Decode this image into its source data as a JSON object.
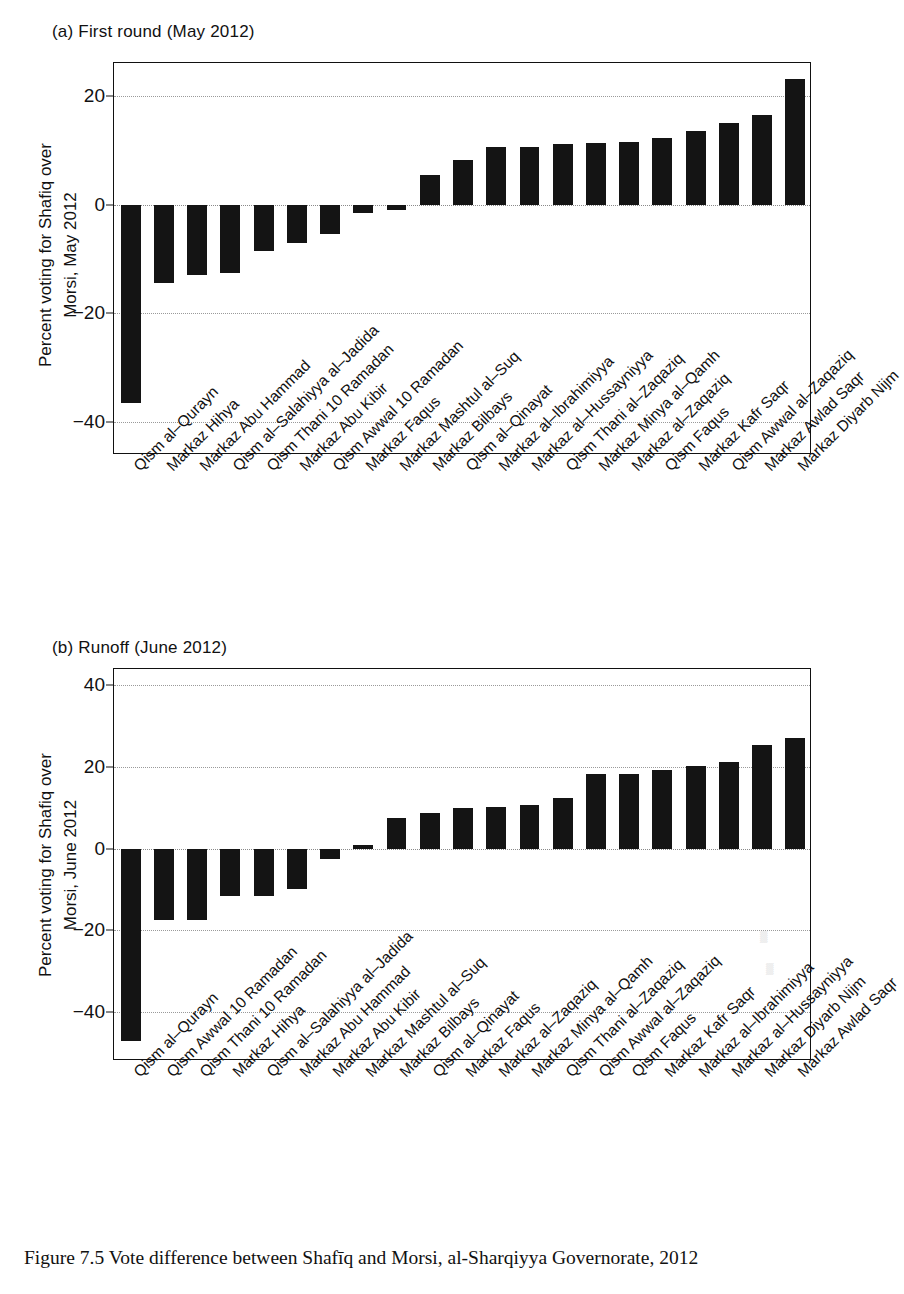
{
  "caption": "Figure 7.5  Vote difference between Shafīq and Morsi, al-Sharqiyya Governorate, 2012",
  "panel_a": {
    "title": "(a) First round (May 2012)",
    "ylabel_line1": "Percent voting for Shafiq over",
    "ylabel_line2": "Morsi, May 2012"
  },
  "panel_b": {
    "title": "(b) Runoff (June 2012)",
    "ylabel_line1": "Percent voting for Shafiq over",
    "ylabel_line2": "Morsi, June 2012"
  },
  "chart_data": [
    {
      "type": "bar",
      "title": "(a) First round (May 2012)",
      "xlabel": "",
      "ylabel": "Percent voting for Shafiq over Morsi, May 2012",
      "ylim": [
        -46,
        26
      ],
      "yticks": [
        20,
        0,
        -20,
        -40
      ],
      "ytick_labels": [
        "20",
        "0",
        "-20",
        "-40"
      ],
      "grid": true,
      "legend": "none",
      "categories": [
        "Qism al-Qurayn",
        "Markaz Hihya",
        "Markaz Abu Hammad",
        "Qism al-Salahiyya al-Jadida",
        "Qism Thani 10 Ramadan",
        "Markaz Abu Kibir",
        "Qism Awwal 10 Ramadan",
        "Markaz Faqus",
        "Markaz Mashtul al-Suq",
        "Markaz Bilbays",
        "Qism al-Qinayat",
        "Markaz al-Ibrahimiyya",
        "Markaz al-Hussayniyya",
        "Qism Thani al-Zaqaziq",
        "Markaz Minya al-Qamh",
        "Markaz al-Zaqaziq",
        "Qism Faqus",
        "Markaz Kafr Saqr",
        "Qism Awwal al-Zaqaziq",
        "Markaz Awlad Saqr",
        "Markaz Diyarb Nijm"
      ],
      "values": [
        -36.5,
        -14.5,
        -13.0,
        -12.5,
        -8.5,
        -7.0,
        -5.5,
        -1.5,
        -1.0,
        5.5,
        8.2,
        10.5,
        10.6,
        11.2,
        11.3,
        11.5,
        12.3,
        13.6,
        15.0,
        16.4,
        23.0
      ]
    },
    {
      "type": "bar",
      "title": "(b) Runoff (June 2012)",
      "xlabel": "",
      "ylabel": "Percent voting for Shafiq over Morsi, June 2012",
      "ylim": [
        -52,
        44
      ],
      "yticks": [
        40,
        20,
        0,
        -20,
        -40
      ],
      "ytick_labels": [
        "40",
        "20",
        "0",
        "-20",
        "-40"
      ],
      "grid": true,
      "legend": "none",
      "categories": [
        "Qism al-Qurayn",
        "Qism Awwal 10 Ramadan",
        "Qism Thani 10 Ramadan",
        "Markaz Hihya",
        "Qism al-Salahiyya al-Jadida",
        "Markaz Abu Hammad",
        "Markaz Abu Kibir",
        "Markaz Mashtul al-Suq",
        "Markaz Bilbays",
        "Qism al-Qinayat",
        "Markaz Faqus",
        "Markaz al-Zaqaziq",
        "Markaz Minya al-Qamh",
        "Qism Thani al-Zaqaziq",
        "Qism Awwal al-Zaqaziq",
        "Qism Faqus",
        "Markaz Kafr Saqr",
        "Markaz al-Ibrahimiyya",
        "Markaz al-Hussayniyya",
        "Markaz Diyarb Nijm",
        "Markaz Awlad Saqr"
      ],
      "values": [
        -47.0,
        -17.5,
        -17.5,
        -11.5,
        -11.5,
        -10.0,
        -2.5,
        1.0,
        7.5,
        8.8,
        10.0,
        10.2,
        10.6,
        12.4,
        18.2,
        18.4,
        19.3,
        20.2,
        21.3,
        25.5,
        27.2
      ]
    }
  ]
}
